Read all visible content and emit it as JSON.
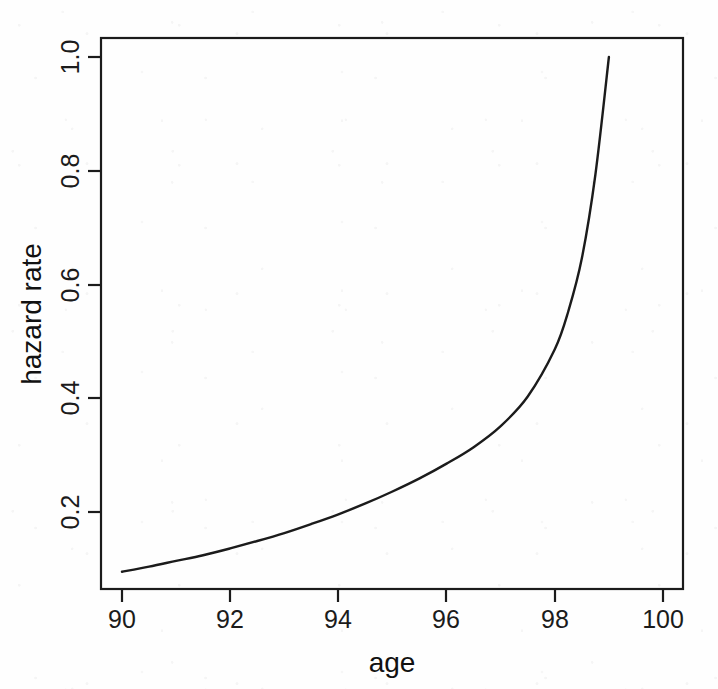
{
  "chart_data": {
    "type": "line",
    "title": "",
    "xlabel": "age",
    "ylabel": "hazard rate",
    "xlim": [
      89.5,
      100.4
    ],
    "ylim": [
      0.065,
      1.06
    ],
    "grid": false,
    "legend": null,
    "x_ticks": [
      "90",
      "92",
      "94",
      "96",
      "98",
      "100"
    ],
    "x_tick_values": [
      90,
      92,
      94,
      96,
      98,
      100
    ],
    "y_ticks": [
      "0.2",
      "0.4",
      "0.6",
      "0.8",
      "1.0"
    ],
    "y_tick_values": [
      0.2,
      0.4,
      0.6,
      0.8,
      1.0
    ],
    "series": [
      {
        "name": "hazard rate",
        "color": "#1b1b1b",
        "x": [
          90.0,
          90.5,
          91.0,
          91.5,
          92.0,
          92.5,
          93.0,
          93.5,
          94.0,
          94.5,
          95.0,
          95.5,
          96.0,
          96.5,
          97.0,
          97.5,
          98.0,
          98.25,
          98.5,
          98.75,
          99.0
        ],
        "y": [
          0.095,
          0.104,
          0.114,
          0.124,
          0.136,
          0.149,
          0.163,
          0.179,
          0.196,
          0.215,
          0.236,
          0.259,
          0.285,
          0.314,
          0.351,
          0.403,
          0.486,
          0.553,
          0.646,
          0.793,
          1.0
        ]
      }
    ],
    "annotations": []
  },
  "axis_style": {
    "line_color": "#1b1b1b",
    "curve_color": "#1b1b1b",
    "background": "#fefefe"
  }
}
